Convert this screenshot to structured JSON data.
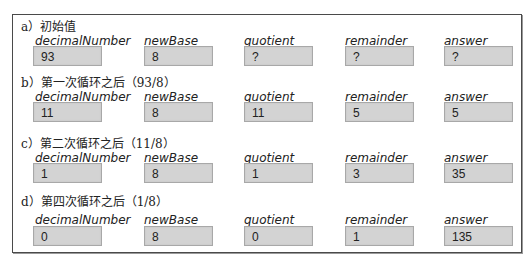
{
  "columns": [
    "decimalNumber",
    "newBase",
    "quotient",
    "remainder",
    "answer"
  ],
  "steps": [
    {
      "label": "a）初始值",
      "headers": [
        "decimalNumber",
        "newBase",
        "quotient",
        "remainder",
        "answer"
      ],
      "values": [
        "93",
        "8",
        "?",
        "?",
        "?"
      ]
    },
    {
      "label": "b）第一次循环之后（93/8）",
      "headers": [
        "decimalNumber",
        "newBase",
        "quotient",
        "remainder",
        "answer"
      ],
      "values": [
        "11",
        "8",
        "11",
        "5",
        "5"
      ]
    },
    {
      "label": "c）第二次循环之后（11/8）",
      "headers": [
        "decimalNumber",
        "newBase",
        "quotient",
        "remainder",
        "answer"
      ],
      "values": [
        "1",
        "8",
        "1",
        "3",
        "35"
      ]
    },
    {
      "label": "d）第四次循环之后（1/8）",
      "headers": [
        "decimalNumber",
        "newBase",
        "quotient",
        "remainder",
        "answer"
      ],
      "values": [
        "0",
        "8",
        "0",
        "1",
        "135"
      ]
    }
  ],
  "colors": {
    "box_fill": "#d3d3d3",
    "box_border": "#a8a8a8",
    "frame_border": "#4a4a4a"
  }
}
